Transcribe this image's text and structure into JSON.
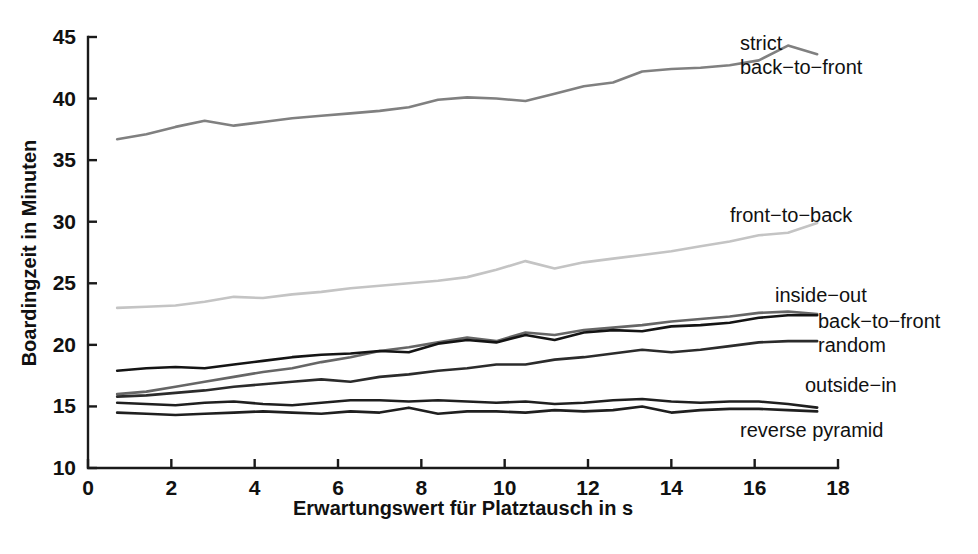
{
  "chart_data": {
    "type": "line",
    "title": "",
    "xlabel": "Erwartungswert für Platztausch in s",
    "ylabel": "Boardingzeit in Minuten",
    "xlim": [
      0,
      18
    ],
    "ylim": [
      10,
      45
    ],
    "xticks": [
      0,
      2,
      4,
      6,
      8,
      10,
      12,
      14,
      16,
      18
    ],
    "yticks": [
      10,
      15,
      20,
      25,
      30,
      35,
      40,
      45
    ],
    "grid": false,
    "legend_position": "inline-right-of-line-ends",
    "x": [
      0.7,
      1.4,
      2.1,
      2.8,
      3.5,
      4.2,
      4.9,
      5.6,
      6.3,
      7.0,
      7.7,
      8.4,
      9.1,
      9.8,
      10.5,
      11.2,
      11.9,
      12.6,
      13.3,
      14.0,
      14.7,
      15.4,
      16.1,
      16.8,
      17.5
    ],
    "series": [
      {
        "name": "strict back-to-front",
        "label": "strict\nback−to−front",
        "label_lines": [
          "strict",
          "back−to−front"
        ],
        "color": "#808080",
        "values": [
          36.7,
          37.1,
          37.7,
          38.2,
          37.8,
          38.1,
          38.4,
          38.6,
          38.8,
          39.0,
          39.3,
          39.9,
          40.1,
          40.0,
          39.8,
          40.4,
          41.0,
          41.3,
          42.2,
          42.4,
          42.5,
          42.7,
          43.1,
          44.3,
          43.6
        ]
      },
      {
        "name": "front-to-back",
        "label": "front−to−back",
        "label_lines": [
          "front−to−back"
        ],
        "color": "#c4c4c4",
        "values": [
          23.0,
          23.1,
          23.2,
          23.5,
          23.9,
          23.8,
          24.1,
          24.3,
          24.6,
          24.8,
          25.0,
          25.2,
          25.5,
          26.1,
          26.8,
          26.2,
          26.7,
          27.0,
          27.3,
          27.6,
          28.0,
          28.4,
          28.9,
          29.1,
          29.9
        ]
      },
      {
        "name": "inside-out",
        "label": "inside−out",
        "label_lines": [
          "inside−out"
        ],
        "color": "#666666",
        "values": [
          16.0,
          16.2,
          16.6,
          17.0,
          17.4,
          17.8,
          18.1,
          18.6,
          19.0,
          19.5,
          19.8,
          20.2,
          20.6,
          20.3,
          21.0,
          20.8,
          21.2,
          21.4,
          21.6,
          21.9,
          22.1,
          22.3,
          22.6,
          22.7,
          22.5
        ]
      },
      {
        "name": "back-to-front",
        "label": "back−to−front",
        "label_lines": [
          "back−to−front"
        ],
        "color": "#141414",
        "values": [
          17.9,
          18.1,
          18.2,
          18.1,
          18.4,
          18.7,
          19.0,
          19.2,
          19.3,
          19.5,
          19.4,
          20.1,
          20.4,
          20.2,
          20.8,
          20.4,
          21.0,
          21.2,
          21.1,
          21.5,
          21.6,
          21.8,
          22.2,
          22.4,
          22.4
        ]
      },
      {
        "name": "random",
        "label": "random",
        "label_lines": [
          "random"
        ],
        "color": "#2b2b2b",
        "values": [
          15.8,
          15.9,
          16.1,
          16.3,
          16.6,
          16.8,
          17.0,
          17.2,
          17.0,
          17.4,
          17.6,
          17.9,
          18.1,
          18.4,
          18.4,
          18.8,
          19.0,
          19.3,
          19.6,
          19.4,
          19.6,
          19.9,
          20.2,
          20.3,
          20.3
        ]
      },
      {
        "name": "outside-in",
        "label": "outside−in",
        "label_lines": [
          "outside−in"
        ],
        "color": "#1f1f1f",
        "values": [
          15.3,
          15.2,
          15.1,
          15.3,
          15.4,
          15.2,
          15.1,
          15.3,
          15.5,
          15.5,
          15.4,
          15.5,
          15.4,
          15.3,
          15.4,
          15.2,
          15.3,
          15.5,
          15.6,
          15.4,
          15.3,
          15.4,
          15.4,
          15.2,
          14.9
        ]
      },
      {
        "name": "reverse pyramid",
        "label": "reverse pyramid",
        "label_lines": [
          "reverse pyramid"
        ],
        "color": "#1f1f1f",
        "values": [
          14.5,
          14.4,
          14.3,
          14.4,
          14.5,
          14.6,
          14.5,
          14.4,
          14.6,
          14.5,
          14.9,
          14.4,
          14.6,
          14.6,
          14.5,
          14.7,
          14.6,
          14.7,
          15.0,
          14.5,
          14.7,
          14.8,
          14.8,
          14.7,
          14.6
        ]
      }
    ],
    "annotations": [
      {
        "id": "label-strict-back-to-front",
        "lines": [
          "strict",
          "back−to−front"
        ],
        "x": 740,
        "y": 50,
        "anchor": "start"
      },
      {
        "id": "label-front-to-back",
        "lines": [
          "front−to−back"
        ],
        "x": 730,
        "y": 222,
        "anchor": "start"
      },
      {
        "id": "label-inside-out",
        "lines": [
          "inside−out"
        ],
        "x": 775,
        "y": 302,
        "anchor": "start"
      },
      {
        "id": "label-back-to-front",
        "lines": [
          "back−to−front"
        ],
        "x": 818,
        "y": 328,
        "anchor": "start"
      },
      {
        "id": "label-random",
        "lines": [
          "random"
        ],
        "x": 818,
        "y": 352,
        "anchor": "start"
      },
      {
        "id": "label-outside-in",
        "lines": [
          "outside−in"
        ],
        "x": 805,
        "y": 392,
        "anchor": "start"
      },
      {
        "id": "label-reverse-pyramid",
        "lines": [
          "reverse pyramid"
        ],
        "x": 740,
        "y": 437,
        "anchor": "start"
      }
    ]
  },
  "axes": {
    "x_title": "Erwartungswert für Platztausch in s",
    "y_title": "Boardingzeit in Minuten",
    "x_tick_labels": [
      "0",
      "2",
      "4",
      "6",
      "8",
      "10",
      "12",
      "14",
      "16",
      "18"
    ],
    "y_tick_labels": [
      "10",
      "15",
      "20",
      "25",
      "30",
      "35",
      "40",
      "45"
    ]
  },
  "colors": {
    "axis": "#1a1a1a",
    "background": "#ffffff",
    "text": "#111111"
  }
}
